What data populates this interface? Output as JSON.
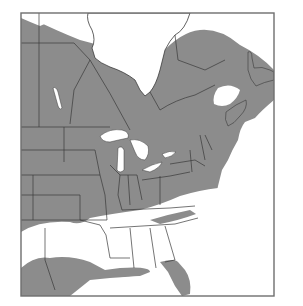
{
  "map": {
    "type": "species range map",
    "region": "Eastern North America",
    "frame": {
      "x": 21,
      "y": 13,
      "width": 253,
      "height": 283
    },
    "colors": {
      "range_fill": "#8c8c8c",
      "background": "#ffffff",
      "water": "#ffffff",
      "border": "#3a3a3a",
      "frame": "#6e6e6e"
    },
    "legend": null,
    "labels": []
  }
}
